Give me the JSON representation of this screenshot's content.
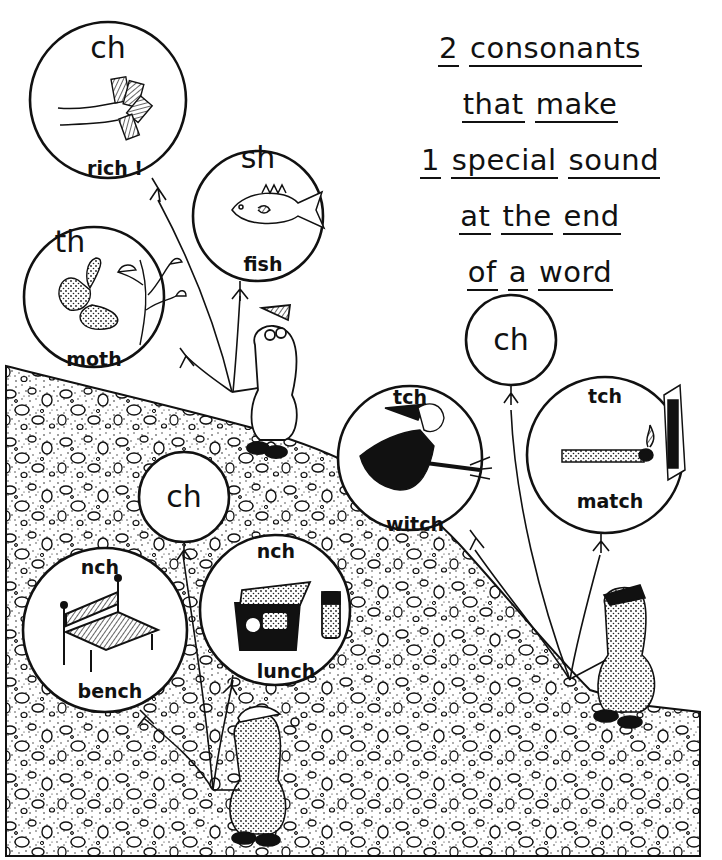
{
  "worksheet": {
    "title_lines": [
      [
        "2",
        "consonants"
      ],
      [
        "that",
        "make"
      ],
      [
        "1",
        "special",
        "sound"
      ],
      [
        "at",
        "the",
        "end"
      ],
      [
        "of",
        "a",
        "word"
      ]
    ]
  },
  "balloons": [
    {
      "id": "rich",
      "digraph": "ch",
      "word": "rich !",
      "picture": "hand-holding-money"
    },
    {
      "id": "fish",
      "digraph": "sh",
      "word": "fish",
      "picture": "fish"
    },
    {
      "id": "moth",
      "digraph": "th",
      "word": "moth",
      "picture": "moth-on-plant"
    },
    {
      "id": "ch-top-right",
      "digraph": "ch",
      "word": "",
      "picture": ""
    },
    {
      "id": "witch",
      "digraph": "tch",
      "word": "witch",
      "picture": "witch-on-broom"
    },
    {
      "id": "match",
      "digraph": "tch",
      "word": "match",
      "picture": "lit-match-and-matchbox"
    },
    {
      "id": "ch-middle",
      "digraph": "ch",
      "word": "",
      "picture": ""
    },
    {
      "id": "bench",
      "digraph": "nch",
      "word": "bench",
      "picture": "park-bench"
    },
    {
      "id": "lunch",
      "digraph": "nch",
      "word": "lunch",
      "picture": "lunchbox-and-thermos"
    }
  ],
  "characters": [
    {
      "id": "top-animal",
      "holds": [
        "rich",
        "fish",
        "moth"
      ]
    },
    {
      "id": "bottom-animal",
      "holds": [
        "ch-middle",
        "bench",
        "lunch"
      ]
    },
    {
      "id": "right-animal",
      "holds": [
        "ch-top-right",
        "witch",
        "match"
      ]
    }
  ]
}
